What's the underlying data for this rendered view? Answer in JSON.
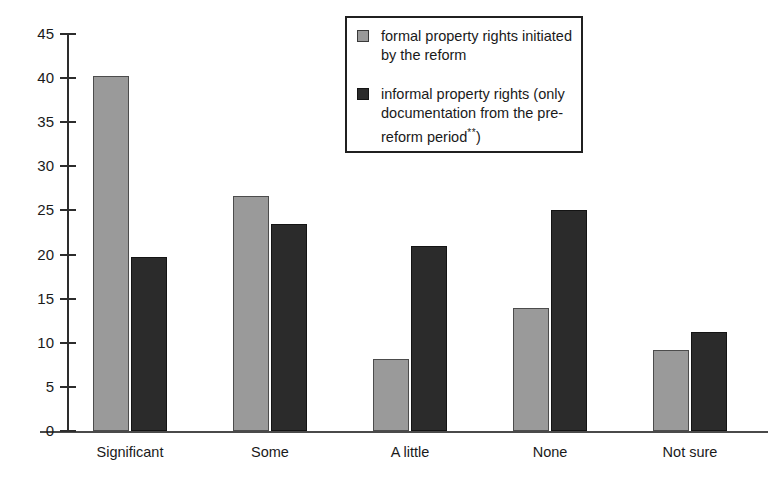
{
  "chart_data": {
    "type": "bar",
    "title": "",
    "xlabel": "",
    "ylabel": "",
    "ylim": [
      0,
      45
    ],
    "grid": false,
    "legend_position": "top-center-inside",
    "categories": [
      "Significant",
      "Some",
      "A little",
      "None",
      "Not sure"
    ],
    "y_ticks": [
      0,
      5,
      10,
      15,
      20,
      25,
      30,
      35,
      40,
      45
    ],
    "series": [
      {
        "name": "formal property rights initiated by the reform",
        "color": "#9a9a9a",
        "values": [
          40.2,
          26.6,
          8.2,
          14.0,
          9.2
        ]
      },
      {
        "name": "informal property rights (only documentation from the pre-reform period**)",
        "color": "#2b2b2b",
        "values": [
          19.7,
          23.5,
          21.0,
          25.1,
          11.2
        ]
      }
    ]
  },
  "legend": {
    "entries": [
      {
        "swatch": "series-light",
        "line1": "formal property rights initiated",
        "line2": "by the reform",
        "line3": ""
      },
      {
        "swatch": "series-dark",
        "line1": "informal property rights (only",
        "line2": "documentation from the pre-",
        "line3": "reform period",
        "sup": "**",
        "tail": ")"
      }
    ]
  },
  "axis": {
    "y_tick_labels": [
      "45",
      "40",
      "35",
      "30",
      "25",
      "20",
      "15",
      "10",
      "5",
      "0"
    ]
  }
}
